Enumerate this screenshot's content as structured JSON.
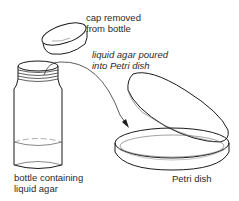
{
  "diagram": {
    "labels": {
      "cap": {
        "line1": "cap removed",
        "line2": "from bottle"
      },
      "pour": {
        "line1": "liquid agar poured",
        "line2": "into Petri dish"
      },
      "bottle": {
        "line1": "bottle containing",
        "line2": "liquid agar"
      },
      "dish": {
        "line1": "Petri dish"
      }
    },
    "elements": [
      "bottle-cap",
      "bottle",
      "petri-dish-lid",
      "petri-dish-base",
      "pour-arrow"
    ],
    "colors": {
      "stroke": "#1a1a1a",
      "thin_stroke": "#555555",
      "text": "#2a2a2a",
      "background": "#ffffff"
    }
  }
}
